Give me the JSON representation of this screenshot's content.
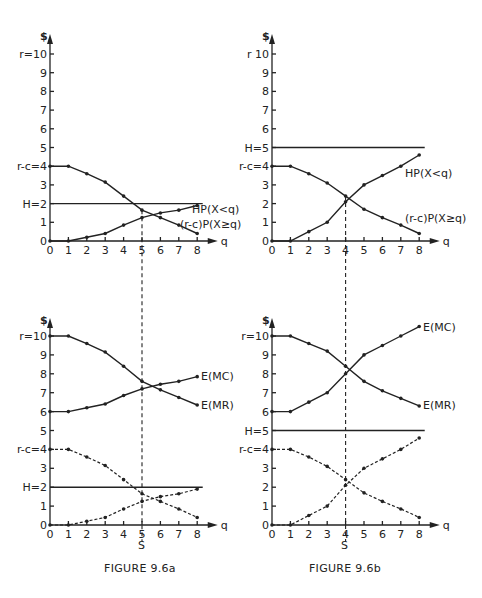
{
  "chart_data": [
    {
      "id": "fig-9-6a-top",
      "panel": "FIGURE 9.6a (top)",
      "type": "line",
      "xlabel": "q",
      "ylabel": "$",
      "x": [
        0,
        1,
        2,
        3,
        4,
        5,
        6,
        7,
        8
      ],
      "x_ticks": [
        "0",
        "1",
        "2",
        "3",
        "4",
        "5",
        "6",
        "7",
        "8"
      ],
      "y_ticks": [
        {
          "v": 0,
          "label": "0"
        },
        {
          "v": 1,
          "label": "1"
        },
        {
          "v": 2,
          "label": "H=2"
        },
        {
          "v": 3,
          "label": "3"
        },
        {
          "v": 4,
          "label": "r-c=4"
        },
        {
          "v": 5,
          "label": "5"
        },
        {
          "v": 6,
          "label": "6"
        },
        {
          "v": 7,
          "label": "7"
        },
        {
          "v": 8,
          "label": "8"
        },
        {
          "v": 9,
          "label": "9"
        },
        {
          "v": 10,
          "label": "r=10"
        }
      ],
      "ylim": [
        0,
        10
      ],
      "hline": {
        "label": "H=2",
        "value": 2
      },
      "series": [
        {
          "name": "HP(X<q)",
          "dashed": false,
          "values": [
            0,
            0,
            0.2,
            0.4,
            0.85,
            1.25,
            1.5,
            1.65,
            1.9
          ]
        },
        {
          "name": "(r-c)P(X≥q)",
          "dashed": false,
          "values": [
            4,
            4,
            3.6,
            3.15,
            2.4,
            1.65,
            1.25,
            0.85,
            0.4
          ]
        }
      ],
      "vline": {
        "q": 5
      }
    },
    {
      "id": "fig-9-6b-top",
      "panel": "FIGURE 9.6b (top)",
      "type": "line",
      "xlabel": "q",
      "ylabel": "$",
      "x": [
        0,
        1,
        2,
        3,
        4,
        5,
        6,
        7,
        8
      ],
      "x_ticks": [
        "0",
        "1",
        "2",
        "3",
        "4",
        "5",
        "6",
        "7",
        "8"
      ],
      "y_ticks": [
        {
          "v": 0,
          "label": "0"
        },
        {
          "v": 1,
          "label": "1"
        },
        {
          "v": 2,
          "label": "2"
        },
        {
          "v": 3,
          "label": "3"
        },
        {
          "v": 4,
          "label": "r-c=4"
        },
        {
          "v": 5,
          "label": "H=5"
        },
        {
          "v": 6,
          "label": "6"
        },
        {
          "v": 7,
          "label": "7"
        },
        {
          "v": 8,
          "label": "8"
        },
        {
          "v": 9,
          "label": "9"
        },
        {
          "v": 10,
          "label": "r 10"
        }
      ],
      "ylim": [
        0,
        10
      ],
      "hline": {
        "label": "H=5",
        "value": 5
      },
      "series": [
        {
          "name": "HP(X<q)",
          "dashed": false,
          "values": [
            0,
            0,
            0.5,
            1.0,
            2.1,
            3.0,
            3.5,
            4.0,
            4.6
          ]
        },
        {
          "name": "(r-c)P(X≥q)",
          "dashed": false,
          "values": [
            4,
            4,
            3.6,
            3.1,
            2.4,
            1.7,
            1.25,
            0.85,
            0.4
          ]
        }
      ],
      "vline": {
        "q": 4
      }
    },
    {
      "id": "fig-9-6a-bottom",
      "panel": "FIGURE 9.6a (bottom)",
      "type": "line",
      "xlabel": "q",
      "ylabel": "$",
      "x": [
        0,
        1,
        2,
        3,
        4,
        5,
        6,
        7,
        8
      ],
      "x_ticks": [
        "0",
        "1",
        "2",
        "3",
        "4",
        "5",
        "6",
        "7",
        "8"
      ],
      "y_ticks": [
        {
          "v": 0,
          "label": "0"
        },
        {
          "v": 1,
          "label": "1"
        },
        {
          "v": 2,
          "label": "H=2"
        },
        {
          "v": 3,
          "label": "3"
        },
        {
          "v": 4,
          "label": "r-c=4"
        },
        {
          "v": 5,
          "label": "5"
        },
        {
          "v": 6,
          "label": "6"
        },
        {
          "v": 7,
          "label": "7"
        },
        {
          "v": 8,
          "label": "8"
        },
        {
          "v": 9,
          "label": "9"
        },
        {
          "v": 10,
          "label": "r=10"
        }
      ],
      "ylim": [
        0,
        10
      ],
      "hline": {
        "label": "H=2",
        "value": 2
      },
      "series": [
        {
          "name": "E(MC)",
          "dashed": false,
          "values": [
            6,
            6,
            6.2,
            6.4,
            6.85,
            7.2,
            7.45,
            7.6,
            7.85
          ]
        },
        {
          "name": "E(MR)",
          "dashed": false,
          "values": [
            10,
            10,
            9.6,
            9.15,
            8.4,
            7.6,
            7.15,
            6.75,
            6.35
          ]
        },
        {
          "name": "HP(X<q) (dashed)",
          "dashed": true,
          "values": [
            0,
            0,
            0.2,
            0.4,
            0.85,
            1.25,
            1.5,
            1.65,
            1.9
          ]
        },
        {
          "name": "(r-c)P(X≥q) (dashed)",
          "dashed": true,
          "values": [
            4,
            4,
            3.6,
            3.15,
            2.4,
            1.65,
            1.25,
            0.85,
            0.4
          ]
        }
      ],
      "vline": {
        "q": 5,
        "label": "S"
      }
    },
    {
      "id": "fig-9-6b-bottom",
      "panel": "FIGURE 9.6b (bottom)",
      "type": "line",
      "xlabel": "q",
      "ylabel": "$",
      "x": [
        0,
        1,
        2,
        3,
        4,
        5,
        6,
        7,
        8
      ],
      "x_ticks": [
        "0",
        "1",
        "2",
        "3",
        "4",
        "5",
        "6",
        "7",
        "8"
      ],
      "y_ticks": [
        {
          "v": 0,
          "label": "0"
        },
        {
          "v": 1,
          "label": "1"
        },
        {
          "v": 2,
          "label": "2"
        },
        {
          "v": 3,
          "label": "3"
        },
        {
          "v": 4,
          "label": "r-c=4"
        },
        {
          "v": 5,
          "label": "H=5"
        },
        {
          "v": 6,
          "label": "6"
        },
        {
          "v": 7,
          "label": "7"
        },
        {
          "v": 8,
          "label": "8"
        },
        {
          "v": 9,
          "label": "9"
        },
        {
          "v": 10,
          "label": "r=10"
        }
      ],
      "ylim": [
        0,
        10.5
      ],
      "hline": {
        "label": "H=5",
        "value": 5
      },
      "series": [
        {
          "name": "E(MC)",
          "dashed": false,
          "values": [
            6,
            6,
            6.5,
            7.0,
            8.0,
            9.0,
            9.5,
            10.0,
            10.5
          ]
        },
        {
          "name": "E(MR)",
          "dashed": false,
          "values": [
            10,
            10,
            9.6,
            9.2,
            8.4,
            7.6,
            7.1,
            6.7,
            6.3
          ]
        },
        {
          "name": "HP(X<q) (dashed)",
          "dashed": true,
          "values": [
            0,
            0,
            0.5,
            1.0,
            2.1,
            3.0,
            3.5,
            4.0,
            4.6
          ]
        },
        {
          "name": "(r-c)P(X≥q) (dashed)",
          "dashed": true,
          "values": [
            4,
            4,
            3.6,
            3.1,
            2.4,
            1.7,
            1.25,
            0.85,
            0.4
          ]
        }
      ],
      "vline": {
        "q": 4,
        "label": "S"
      }
    }
  ],
  "labels": {
    "dollar": "$",
    "q": "q",
    "hp_left": "HP(X<q)",
    "rc_left": "(r-c)P(X≥q)",
    "hp_right": "HP(X<q)",
    "rc_right": "(r-c)P(X≥q)",
    "emc": "E(MC)",
    "emr": "E(MR)",
    "s": "S"
  },
  "captions": {
    "left": "FIGURE 9.6a",
    "right": "FIGURE 9.6b"
  }
}
